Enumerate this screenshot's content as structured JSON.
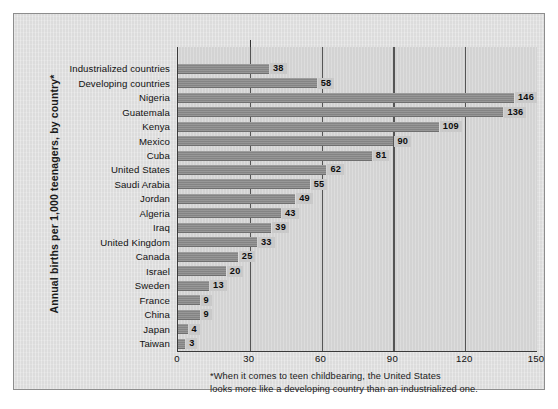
{
  "chart_data": {
    "type": "bar",
    "orientation": "horizontal",
    "title": "",
    "subtitle": "",
    "xlabel": "",
    "ylabel": "Annual births per 1,000 teenagers, by country*",
    "xlim": [
      0,
      150
    ],
    "ylim": null,
    "grid": true,
    "gridlines_x": [
      30,
      60,
      90,
      120
    ],
    "xticks": [
      "0",
      "30",
      "60",
      "90",
      "120",
      "150"
    ],
    "xtick_values": [
      0,
      30,
      60,
      90,
      120,
      150
    ],
    "legend": null,
    "legend_position": "none",
    "categories": [
      "Industrialized countries",
      "Developing countries",
      "Nigeria",
      "Guatemala",
      "Kenya",
      "Mexico",
      "Cuba",
      "United States",
      "Saudi Arabia",
      "Jordan",
      "Algeria",
      "Iraq",
      "United Kingdom",
      "Canada",
      "Israel",
      "Sweden",
      "France",
      "China",
      "Japan",
      "Taiwan"
    ],
    "values": [
      38,
      58,
      146,
      136,
      109,
      90,
      81,
      62,
      55,
      49,
      43,
      39,
      33,
      25,
      20,
      13,
      9,
      9,
      4,
      3
    ],
    "value_labels": [
      "38",
      "58",
      "146",
      "136",
      "109",
      "90",
      "81",
      "62",
      "55",
      "49",
      "43",
      "39",
      "33",
      "25",
      "20",
      "13",
      "9",
      "9",
      "4",
      "3"
    ],
    "annotations": [
      "*When it comes to teen childbearing, the United States",
      "looks more like a developing country than an industrialized one."
    ]
  },
  "footnote": {
    "line1": "*When it comes to teen childbearing, the United States",
    "line2": "looks more like a developing country than an industrialized one."
  },
  "colors": {
    "page_background": "#ffffff",
    "panel_background": "#dcdcdc",
    "plot_background": "#d3d3d3",
    "bar_fill": "#8b8b8b",
    "value_label_background": "#c9c9c9",
    "axis_line": "#3a3a3a",
    "gridline": "#555555",
    "text": "#111111"
  }
}
